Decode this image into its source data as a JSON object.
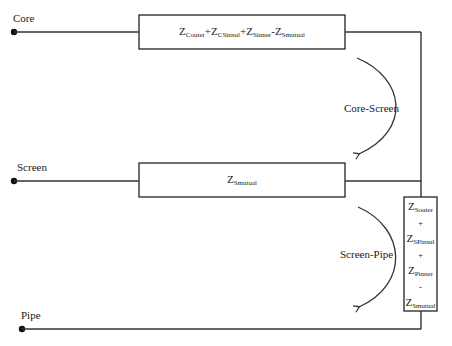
{
  "nodes": {
    "core": "Core",
    "screen": "Screen",
    "pipe": "Pipe"
  },
  "boxes": {
    "core_screen": {
      "terms": [
        {
          "sign": "",
          "main": "Z",
          "sub": "Couter"
        },
        {
          "sign": "+",
          "main": "Z",
          "sub": "CSinsul"
        },
        {
          "sign": "+",
          "main": "Z",
          "sub": "Sinner"
        },
        {
          "sign": "-",
          "main": "Z",
          "sub": "Smutual"
        }
      ]
    },
    "screen": {
      "main": "Z",
      "sub": "Smutual"
    },
    "screen_pipe": {
      "t1_main": "Z",
      "t1_sub": "Souter",
      "op1": "+",
      "t2_main": "Z",
      "t2_sub": "SPinsul",
      "op2": "+",
      "t3_main": "Z",
      "t3_sub": "Pinner",
      "op3": "-",
      "t4_main": "Z",
      "t4_sub": "Smutual"
    }
  },
  "arrows": {
    "core_screen": "Core-Screen",
    "screen_pipe": "Screen-Pipe"
  },
  "colors": {
    "line": "#333333",
    "text": "#222222",
    "background": "#ffffff"
  }
}
